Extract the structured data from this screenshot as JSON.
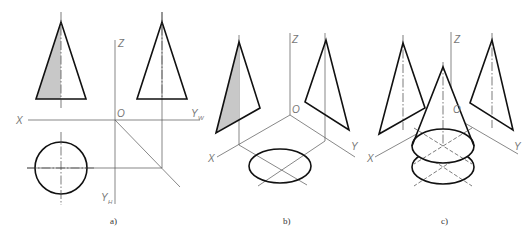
{
  "figure": {
    "panels": [
      {
        "id": "a",
        "caption": "a)",
        "description": "Three-view orthographic projection of a cone",
        "axis_labels": {
          "z": "Z",
          "origin": "O",
          "x": "X",
          "yw": "Y",
          "yw_sub": "W",
          "yh": "Y",
          "yh_sub": "H"
        }
      },
      {
        "id": "b",
        "caption": "b)",
        "description": "Projections placed on three planes in axonometric view",
        "axis_labels": {
          "z": "Z",
          "origin": "O",
          "x": "X",
          "y": "Y"
        }
      },
      {
        "id": "c",
        "caption": "c)",
        "description": "Cone reconstructed in space from its projections",
        "axis_labels": {
          "z": "Z",
          "origin": "O",
          "x": "X",
          "y": "Y"
        }
      }
    ],
    "colors": {
      "outline": "#111111",
      "shade": "#c8c8c8",
      "label": "#777777"
    }
  }
}
